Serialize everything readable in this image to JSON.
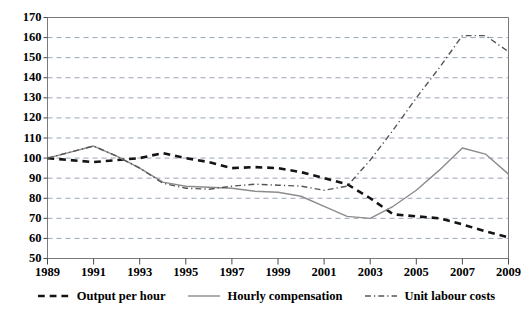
{
  "chart_data": {
    "type": "line",
    "title": "",
    "subtitle": "",
    "xlabel": "",
    "ylabel": "",
    "x": [
      1989,
      1990,
      1991,
      1992,
      1993,
      1994,
      1995,
      1996,
      1997,
      1998,
      1999,
      2000,
      2001,
      2002,
      2003,
      2004,
      2005,
      2006,
      2007,
      2008,
      2009
    ],
    "xlim": [
      1989,
      2009
    ],
    "ylim": [
      50,
      170
    ],
    "yticks": [
      50,
      60,
      70,
      80,
      90,
      100,
      110,
      120,
      130,
      140,
      150,
      160,
      170
    ],
    "xticks": [
      1989,
      1991,
      1993,
      1995,
      1997,
      1999,
      2001,
      2003,
      2005,
      2007,
      2009
    ],
    "grid": true,
    "grid_style": "horizontal-dashed",
    "legend_position": "bottom",
    "series": [
      {
        "name": "Output per hour",
        "style": "dashed",
        "color": "#141414",
        "width": 2.6,
        "values": [
          100,
          99,
          98,
          99,
          100,
          102.5,
          100,
          98,
          95,
          95.5,
          95,
          93,
          90,
          87,
          80,
          72,
          71,
          70,
          67,
          63.5,
          60.5
        ]
      },
      {
        "name": "Hourly compensation",
        "style": "solid",
        "color": "#8c8c8c",
        "width": 1.4,
        "values": [
          100,
          103,
          106,
          101,
          95,
          88,
          86,
          85.5,
          85,
          83.5,
          83,
          81,
          76,
          71,
          70,
          76,
          84,
          94,
          105,
          102,
          92
        ]
      },
      {
        "name": "Unit labour costs",
        "style": "dash-dot",
        "color": "#555555",
        "width": 1.4,
        "values": [
          100,
          103,
          106,
          101,
          95,
          87.5,
          85,
          84.5,
          86,
          87,
          86.5,
          86,
          84,
          86,
          99,
          114,
          130,
          145,
          161,
          161,
          153
        ]
      }
    ]
  },
  "legend": {
    "items": [
      {
        "label": "Output per hour",
        "icon": "dashed-line-swatch"
      },
      {
        "label": "Hourly compensation",
        "icon": "solid-line-swatch"
      },
      {
        "label": "Unit labour costs",
        "icon": "dash-dot-line-swatch"
      }
    ]
  }
}
